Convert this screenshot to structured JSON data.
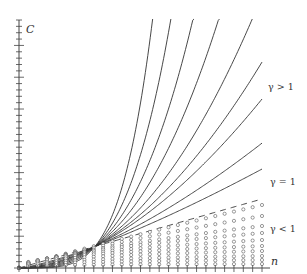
{
  "chart_data": {
    "type": "line",
    "title": "",
    "xlabel": "n",
    "ylabel": "C",
    "grid": false,
    "legend": "inline annotations at right",
    "annotations": [
      "γ > 1",
      "γ = 1",
      "γ < 1"
    ],
    "x_domain": [
      0,
      1
    ],
    "note": "Family of curves C ∝ n^γ; solid curves for γ > 1, dashed line for γ = 1, open-circle markers for γ < 1. Values are normalized (t = n/n_max, height in pixel-scale units where γ=1 line reaches 69 at t=1).",
    "scale_K": 3.2,
    "gamma_eq1_end_height": 69,
    "series": [
      {
        "name": "γ > 1 (solid)",
        "style": "solid",
        "gammas": [
          4.33,
          3.53,
          2.95,
          2.53,
          2.18,
          1.94,
          1.77,
          1.51,
          1.31
        ]
      },
      {
        "name": "γ = 1 (dashed)",
        "style": "dashed",
        "gammas": [
          1.0
        ]
      },
      {
        "name": "γ < 1 (circles)",
        "style": "circles",
        "end_heights": [
          63,
          52,
          42,
          35,
          28,
          22,
          17,
          12,
          8,
          4
        ],
        "exponents": [
          0.9,
          0.8,
          0.7,
          0.6,
          0.5,
          0.4,
          0.35,
          0.3,
          0.25,
          0.2
        ],
        "n_points": 27
      }
    ],
    "y_ticks_count": 39,
    "x_ticks_count": 27
  },
  "labels": {
    "y_axis": "C",
    "x_axis": "n",
    "gt1": "γ > 1",
    "eq1": "γ = 1",
    "lt1": "γ < 1"
  }
}
